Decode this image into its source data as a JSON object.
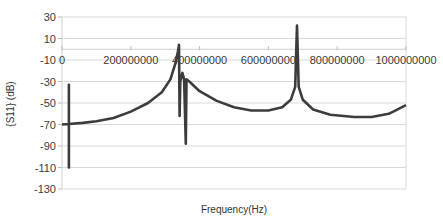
{
  "chart_data": {
    "type": "line",
    "title": "",
    "xlabel": "Frequency(Hz)",
    "ylabel": "{S11} (dB)",
    "xlim": [
      0,
      1000000000
    ],
    "ylim": [
      -130,
      30
    ],
    "grid": true,
    "legend": "none",
    "x_ticks": [
      "0",
      "200000000",
      "400000000",
      "600000000",
      "800000000",
      "1000000000"
    ],
    "x_tick_values": [
      0,
      200000000,
      400000000,
      600000000,
      800000000,
      1000000000
    ],
    "y_ticks": [
      30,
      10,
      -10,
      -30,
      -50,
      -70,
      -90,
      -110,
      -130
    ],
    "line_color": "#3c3c3c",
    "series": [
      {
        "name": "S11",
        "points": [
          [
            0,
            -70
          ],
          [
            20000000,
            -69.5
          ],
          [
            20000000,
            -33
          ],
          [
            20000000,
            -110
          ],
          [
            20000000,
            -69.5
          ],
          [
            60000000,
            -68.5
          ],
          [
            100000000,
            -67
          ],
          [
            150000000,
            -64
          ],
          [
            200000000,
            -58
          ],
          [
            250000000,
            -50
          ],
          [
            290000000,
            -40
          ],
          [
            315000000,
            -28
          ],
          [
            330000000,
            -13
          ],
          [
            337000000,
            -2
          ],
          [
            340000000,
            4
          ],
          [
            342000000,
            -62
          ],
          [
            344000000,
            -30
          ],
          [
            350000000,
            -22
          ],
          [
            355000000,
            -28
          ],
          [
            360000000,
            -88
          ],
          [
            362000000,
            -28
          ],
          [
            370000000,
            -30
          ],
          [
            400000000,
            -39
          ],
          [
            450000000,
            -48
          ],
          [
            500000000,
            -54
          ],
          [
            550000000,
            -57
          ],
          [
            600000000,
            -57
          ],
          [
            640000000,
            -54
          ],
          [
            665000000,
            -47
          ],
          [
            678000000,
            -35
          ],
          [
            683000000,
            22
          ],
          [
            688000000,
            -35
          ],
          [
            700000000,
            -47
          ],
          [
            730000000,
            -56
          ],
          [
            780000000,
            -61
          ],
          [
            850000000,
            -63
          ],
          [
            900000000,
            -63
          ],
          [
            950000000,
            -60
          ],
          [
            1000000000,
            -52
          ]
        ]
      }
    ]
  }
}
